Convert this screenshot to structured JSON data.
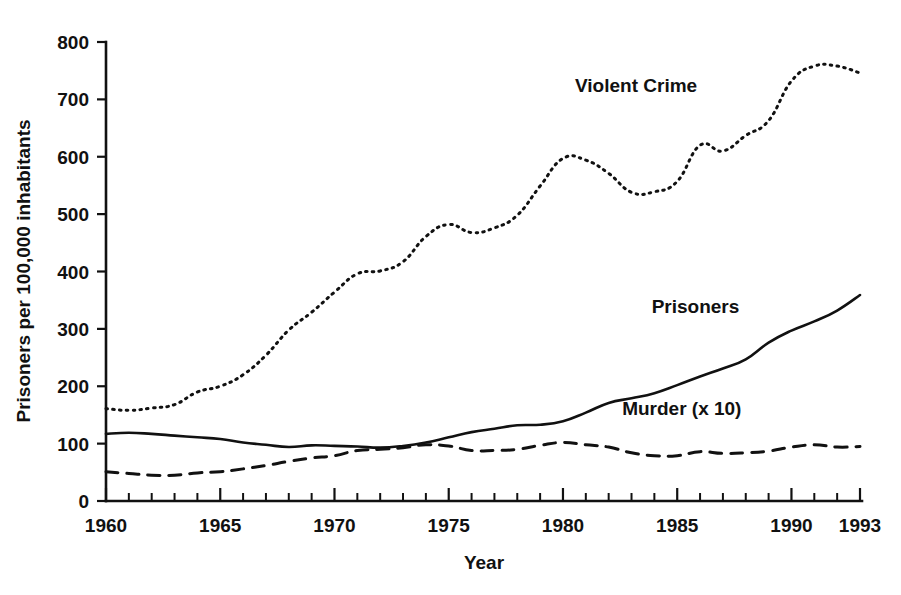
{
  "chart_data": {
    "type": "line",
    "title": "",
    "xlabel": "Year",
    "ylabel": "Prisoners per 100,000 inhabitants",
    "xlim": [
      1960,
      1993
    ],
    "ylim": [
      0,
      800
    ],
    "xticks": [
      1960,
      1965,
      1970,
      1975,
      1980,
      1985,
      1990,
      1993
    ],
    "xtick_labels": [
      "1960",
      "1965",
      "1970",
      "1975",
      "1980",
      "1985",
      "1990",
      "1993"
    ],
    "xtick_minor_step": 1,
    "yticks": [
      0,
      100,
      200,
      300,
      400,
      500,
      600,
      700,
      800
    ],
    "ytick_labels": [
      "0",
      "100",
      "200",
      "300",
      "400",
      "500",
      "600",
      "700",
      "800"
    ],
    "grid": false,
    "legend": "inline-annotations",
    "x": [
      1960,
      1961,
      1962,
      1963,
      1964,
      1965,
      1966,
      1967,
      1968,
      1969,
      1970,
      1971,
      1972,
      1973,
      1974,
      1975,
      1976,
      1977,
      1978,
      1979,
      1980,
      1981,
      1982,
      1983,
      1984,
      1985,
      1986,
      1987,
      1988,
      1989,
      1990,
      1991,
      1992,
      1993
    ],
    "series": [
      {
        "name": "Violent Crime",
        "style": "dotted",
        "label_x": 1983.2,
        "label_y": 712,
        "values": [
          161,
          158,
          162,
          168,
          190,
          200,
          220,
          254,
          298,
          329,
          364,
          396,
          401,
          417,
          461,
          482,
          468,
          476,
          498,
          549,
          597,
          594,
          571,
          538,
          539,
          557,
          620,
          610,
          637,
          663,
          732,
          758,
          758,
          746
        ]
      },
      {
        "name": "Prisoners",
        "style": "solid",
        "label_x": 1985.8,
        "label_y": 327,
        "values": [
          117,
          119,
          117,
          114,
          111,
          108,
          102,
          98,
          94,
          97,
          96,
          95,
          93,
          96,
          102,
          111,
          120,
          126,
          132,
          133,
          139,
          154,
          171,
          179,
          188,
          202,
          217,
          231,
          247,
          276,
          297,
          313,
          332,
          359
        ]
      },
      {
        "name": "Murder (x 10)",
        "style": "dashed",
        "label_x": 1985.2,
        "label_y": 150,
        "values": [
          51,
          48,
          45,
          45,
          49,
          51,
          56,
          62,
          69,
          75,
          79,
          88,
          90,
          93,
          98,
          96,
          88,
          88,
          90,
          97,
          102,
          98,
          94,
          84,
          79,
          79,
          86,
          83,
          84,
          87,
          94,
          98,
          94,
          95
        ]
      }
    ]
  },
  "axis": {
    "y_title": "Prisoners per 100,000 inhabitants",
    "x_title": "Year"
  }
}
